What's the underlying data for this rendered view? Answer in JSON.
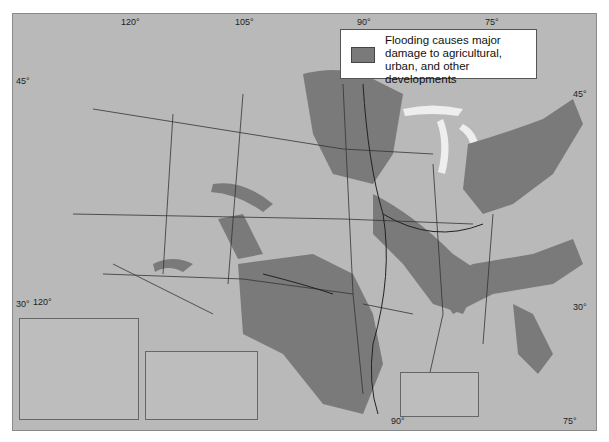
{
  "map": {
    "title": "Flooding in the United States",
    "legend": {
      "swatch_color": "#7a7a7a",
      "label": "Flooding causes major damage to agricultural, urban, and other developments"
    },
    "colors": {
      "land": "#b9b9b9",
      "flood_area": "#7a7a7a",
      "water": "#eeeeee",
      "border": "#333333",
      "background": "#ffffff"
    },
    "graticule_labels": {
      "top": [
        "120°",
        "105°",
        "90°",
        "75°"
      ],
      "left": [
        "45°",
        "30°"
      ],
      "right": [
        "45°",
        "30°"
      ],
      "bottom": [
        "90°",
        "75°"
      ],
      "inset_alaska": "120°"
    },
    "insets": [
      "Alaska",
      "Hawaii",
      "Puerto Rico"
    ]
  }
}
